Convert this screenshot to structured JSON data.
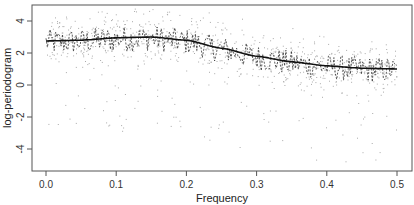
{
  "chart_data": {
    "type": "scatter",
    "title": "",
    "xlabel": "Frequency",
    "ylabel": "log-periodogram",
    "xlim": [
      -0.01,
      0.52
    ],
    "ylim": [
      -5.3,
      5.2
    ],
    "x_ticks": [
      0.0,
      0.1,
      0.2,
      0.3,
      0.4,
      0.5
    ],
    "x_tick_labels": [
      "0.0",
      "0.1",
      "0.2",
      "0.3",
      "0.4",
      "0.5"
    ],
    "y_ticks": [
      -4,
      -2,
      0,
      2,
      4
    ],
    "y_tick_labels": [
      "-4",
      "-2",
      "0",
      "2",
      "4"
    ],
    "grid": false,
    "legend": null,
    "series": [
      {
        "name": "log-periodogram replicates",
        "style": "light grey points",
        "description": "scattered grey points, mostly between 0 and 4.5, some down to -5"
      },
      {
        "name": "mean log-periodogram",
        "style": "dashed dark line",
        "description": "jagged dashed line oscillating around the smooth curve"
      },
      {
        "name": "true log-spectrum",
        "style": "solid black line",
        "x": [
          0.0,
          0.05,
          0.1,
          0.15,
          0.2,
          0.25,
          0.3,
          0.35,
          0.4,
          0.45,
          0.5
        ],
        "values": [
          2.75,
          2.8,
          2.95,
          3.0,
          2.8,
          2.3,
          1.8,
          1.45,
          1.2,
          1.05,
          1.0
        ]
      }
    ]
  }
}
